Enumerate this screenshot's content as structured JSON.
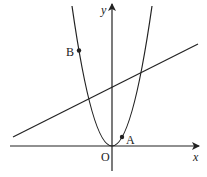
{
  "diagram": {
    "axes": {
      "x_label": "x",
      "y_label": "y",
      "origin_label": "O"
    },
    "points": [
      {
        "name": "A",
        "label": "A"
      },
      {
        "name": "B",
        "label": "B"
      }
    ],
    "curves": [
      {
        "type": "parabola",
        "vertex": "O"
      },
      {
        "type": "line"
      }
    ],
    "colors": {
      "stroke": "#222222",
      "background": "#ffffff"
    }
  }
}
